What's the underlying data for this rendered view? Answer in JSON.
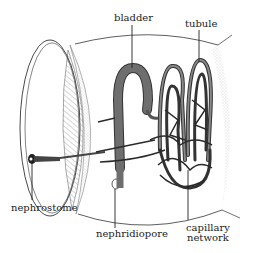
{
  "figure": {
    "labels": {
      "bladder": "bladder",
      "tubule": "tubule",
      "nephrostome": "nephrostome",
      "nephridiopore": "nephridiopore",
      "capillary_line1": "capillary",
      "capillary_line2": "network"
    },
    "colors": {
      "line": "#222222",
      "bladder_fill": "#6e6e6e",
      "tubule": "#555555",
      "capillary": "#2a2a2a",
      "stipple": "#999999",
      "background": "#ffffff"
    }
  }
}
